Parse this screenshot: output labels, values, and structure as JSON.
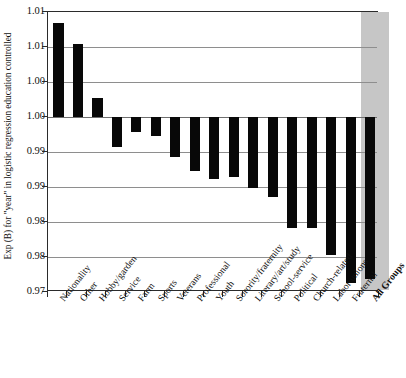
{
  "figure": {
    "scan_artifact_text": "",
    "background_color": "#ffffff",
    "frame_color": "#2b2b2b",
    "bar_color": "#080808",
    "highlight_band_color": "#c6c6c6",
    "gridline_color": "#8e8e8e"
  },
  "axis": {
    "y_title": "Exp (B) for \"year\" in logistic regression education controlled",
    "y_tick_labels": [
      "1.01",
      "1.01",
      "1.00",
      "1.00",
      "0.99",
      "0.99",
      "0.98",
      "0.98",
      "0.97"
    ],
    "y_tick_values": [
      1.015,
      1.01,
      1.005,
      1.0,
      0.995,
      0.99,
      0.985,
      0.98,
      0.975
    ],
    "x_title": ""
  },
  "chart_data": {
    "type": "bar",
    "title": "",
    "subtitle": "",
    "xlabel": "",
    "ylabel": "Exp (B) for \"year\" in logistic regression education controlled",
    "ylim": [
      0.975,
      1.015
    ],
    "baseline": 1.0,
    "grid": true,
    "legend": "none",
    "orientation": "vertical",
    "categories": [
      "Nationality",
      "Other",
      "Hobby/garden",
      "Service",
      "Farm",
      "Sports",
      "Veterans",
      "Professional",
      "Youth",
      "Sorority/fraternity",
      "Literary/art/study",
      "School-service",
      "Political",
      "Church-related",
      "Labor unions",
      "Fraternal",
      "All Groups"
    ],
    "values": [
      1.0135,
      1.0105,
      1.0027,
      0.9957,
      0.9979,
      0.9973,
      0.9943,
      0.9923,
      0.9912,
      0.9915,
      0.9898,
      0.9886,
      0.9842,
      0.9842,
      0.9803,
      0.9763,
      0.9768
    ],
    "highlighted_categories": [
      "All Groups"
    ],
    "ytick_labels": [
      "1.01",
      "1.01",
      "1.00",
      "1.00",
      "0.99",
      "0.99",
      "0.98",
      "0.98",
      "0.97"
    ],
    "ytick_values": [
      1.015,
      1.01,
      1.005,
      1.0,
      0.995,
      0.99,
      0.985,
      0.98,
      0.975
    ]
  }
}
